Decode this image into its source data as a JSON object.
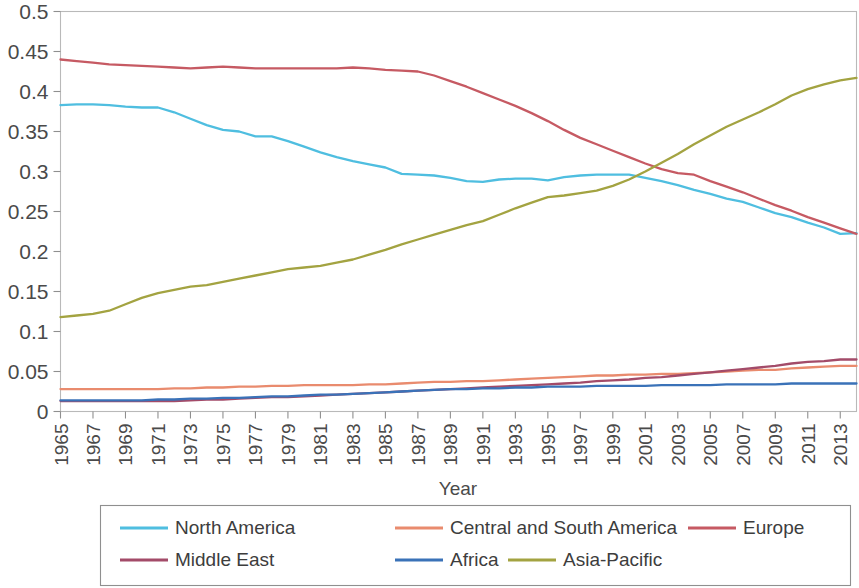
{
  "chart_data": {
    "type": "line",
    "title": "",
    "xlabel": "Year",
    "ylabel": "",
    "xlim": [
      1965,
      2014
    ],
    "ylim": [
      0,
      0.5
    ],
    "grid": false,
    "legend_position": "bottom",
    "y_ticks": [
      "0",
      "0.05",
      "0.1",
      "0.15",
      "0.2",
      "0.25",
      "0.3",
      "0.35",
      "0.4",
      "0.45",
      "0.5"
    ],
    "y_tick_values": [
      0,
      0.05,
      0.1,
      0.15,
      0.2,
      0.25,
      0.3,
      0.35,
      0.4,
      0.45,
      0.5
    ],
    "x_tick_labels": [
      "1965",
      "1967",
      "1969",
      "1971",
      "1973",
      "1975",
      "1977",
      "1979",
      "1981",
      "1983",
      "1985",
      "1987",
      "1989",
      "1991",
      "1993",
      "1995",
      "1997",
      "1999",
      "2001",
      "2003",
      "2005",
      "2007",
      "2009",
      "2011",
      "2013"
    ],
    "x": [
      1965,
      1966,
      1967,
      1968,
      1969,
      1970,
      1971,
      1972,
      1973,
      1974,
      1975,
      1976,
      1977,
      1978,
      1979,
      1980,
      1981,
      1982,
      1983,
      1984,
      1985,
      1986,
      1987,
      1988,
      1989,
      1990,
      1991,
      1992,
      1993,
      1994,
      1995,
      1996,
      1997,
      1998,
      1999,
      2000,
      2001,
      2002,
      2003,
      2004,
      2005,
      2006,
      2007,
      2008,
      2009,
      2010,
      2011,
      2012,
      2013,
      2014
    ],
    "series": [
      {
        "name": "North America",
        "color": "#4FBEE0",
        "values": [
          0.383,
          0.384,
          0.384,
          0.383,
          0.381,
          0.38,
          0.38,
          0.374,
          0.366,
          0.358,
          0.352,
          0.35,
          0.344,
          0.344,
          0.338,
          0.331,
          0.324,
          0.318,
          0.313,
          0.309,
          0.305,
          0.297,
          0.296,
          0.295,
          0.292,
          0.288,
          0.287,
          0.29,
          0.291,
          0.291,
          0.289,
          0.293,
          0.295,
          0.296,
          0.296,
          0.296,
          0.292,
          0.288,
          0.283,
          0.277,
          0.272,
          0.266,
          0.262,
          0.255,
          0.248,
          0.243,
          0.236,
          0.23,
          0.222,
          0.223
        ]
      },
      {
        "name": "Central and South America",
        "color": "#E98B6E",
        "values": [
          0.028,
          0.028,
          0.028,
          0.028,
          0.028,
          0.028,
          0.028,
          0.029,
          0.029,
          0.03,
          0.03,
          0.031,
          0.031,
          0.032,
          0.032,
          0.033,
          0.033,
          0.033,
          0.033,
          0.034,
          0.034,
          0.035,
          0.036,
          0.037,
          0.037,
          0.038,
          0.038,
          0.039,
          0.04,
          0.041,
          0.042,
          0.043,
          0.044,
          0.045,
          0.045,
          0.046,
          0.046,
          0.047,
          0.047,
          0.048,
          0.049,
          0.05,
          0.051,
          0.052,
          0.052,
          0.054,
          0.055,
          0.056,
          0.057,
          0.057
        ]
      },
      {
        "name": "Europe",
        "color": "#C65A63",
        "values": [
          0.44,
          0.438,
          0.436,
          0.434,
          0.433,
          0.432,
          0.431,
          0.43,
          0.429,
          0.43,
          0.431,
          0.43,
          0.429,
          0.429,
          0.429,
          0.429,
          0.429,
          0.429,
          0.43,
          0.429,
          0.427,
          0.426,
          0.425,
          0.42,
          0.413,
          0.406,
          0.398,
          0.39,
          0.382,
          0.373,
          0.363,
          0.352,
          0.342,
          0.334,
          0.326,
          0.318,
          0.31,
          0.303,
          0.298,
          0.296,
          0.288,
          0.281,
          0.274,
          0.266,
          0.258,
          0.251,
          0.243,
          0.236,
          0.229,
          0.222
        ]
      },
      {
        "name": "Middle East",
        "color": "#A34B69",
        "values": [
          0.013,
          0.013,
          0.013,
          0.013,
          0.013,
          0.013,
          0.013,
          0.013,
          0.014,
          0.015,
          0.015,
          0.016,
          0.017,
          0.018,
          0.018,
          0.019,
          0.02,
          0.021,
          0.022,
          0.023,
          0.024,
          0.025,
          0.026,
          0.027,
          0.028,
          0.029,
          0.03,
          0.031,
          0.032,
          0.033,
          0.034,
          0.035,
          0.036,
          0.038,
          0.039,
          0.04,
          0.042,
          0.043,
          0.045,
          0.047,
          0.049,
          0.051,
          0.053,
          0.055,
          0.057,
          0.06,
          0.062,
          0.063,
          0.065,
          0.065
        ]
      },
      {
        "name": "Africa",
        "color": "#3A72B8",
        "values": [
          0.014,
          0.014,
          0.014,
          0.014,
          0.014,
          0.014,
          0.015,
          0.015,
          0.016,
          0.016,
          0.017,
          0.017,
          0.018,
          0.019,
          0.019,
          0.02,
          0.021,
          0.021,
          0.022,
          0.023,
          0.024,
          0.025,
          0.026,
          0.027,
          0.028,
          0.028,
          0.029,
          0.029,
          0.03,
          0.03,
          0.031,
          0.031,
          0.031,
          0.032,
          0.032,
          0.032,
          0.032,
          0.033,
          0.033,
          0.033,
          0.033,
          0.034,
          0.034,
          0.034,
          0.034,
          0.035,
          0.035,
          0.035,
          0.035,
          0.035
        ]
      },
      {
        "name": "Asia-Pacific",
        "color": "#A3A341",
        "values": [
          0.118,
          0.12,
          0.122,
          0.126,
          0.134,
          0.142,
          0.148,
          0.152,
          0.156,
          0.158,
          0.162,
          0.166,
          0.17,
          0.174,
          0.178,
          0.18,
          0.182,
          0.186,
          0.19,
          0.196,
          0.202,
          0.209,
          0.215,
          0.221,
          0.227,
          0.233,
          0.238,
          0.246,
          0.254,
          0.261,
          0.268,
          0.27,
          0.273,
          0.276,
          0.282,
          0.29,
          0.3,
          0.311,
          0.322,
          0.334,
          0.345,
          0.356,
          0.365,
          0.374,
          0.384,
          0.395,
          0.403,
          0.409,
          0.414,
          0.417
        ]
      }
    ],
    "legend_rows": [
      [
        "North America",
        "Central and South America",
        "Europe"
      ],
      [
        "Middle East",
        "Africa",
        "Asia-Pacific"
      ]
    ]
  }
}
